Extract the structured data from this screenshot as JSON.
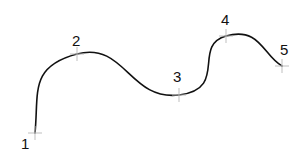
{
  "diagram": {
    "type": "spline-through-points",
    "curve_color": "#111111",
    "tick_color": "#b8b8b8",
    "points": [
      {
        "id": "1",
        "label": "1",
        "x": 35,
        "y": 133,
        "label_x": 21,
        "label_y": 149
      },
      {
        "id": "2",
        "label": "2",
        "x": 77,
        "y": 54,
        "label_x": 72,
        "label_y": 46
      },
      {
        "id": "3",
        "label": "3",
        "x": 179,
        "y": 95,
        "label_x": 173,
        "label_y": 82
      },
      {
        "id": "4",
        "label": "4",
        "x": 226,
        "y": 36,
        "label_x": 221,
        "label_y": 25
      },
      {
        "id": "5",
        "label": "5",
        "x": 282,
        "y": 66,
        "label_x": 280,
        "label_y": 55
      }
    ]
  }
}
